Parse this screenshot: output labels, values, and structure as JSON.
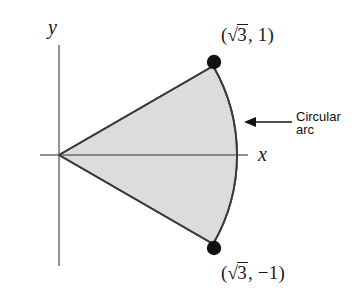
{
  "figure": {
    "background_color": "#ffffff",
    "axes": {
      "x_label": "x",
      "y_label": "y",
      "axis_color": "#6e6e6e",
      "origin_px": [
        59,
        155
      ],
      "x_axis_span_px": [
        40,
        248
      ],
      "y_axis_span_px": [
        45,
        266
      ]
    },
    "sector": {
      "fill_color": "#dcdcdc",
      "stroke_color": "#3a3a3a",
      "radius_units": 2,
      "angle_start_deg": -30,
      "angle_end_deg": 30,
      "center_units": [
        0,
        0
      ],
      "arc_apex_px": [
        237,
        155
      ]
    },
    "points": [
      {
        "name": "upper-endpoint",
        "label": "(√3, 1)",
        "label_x_text": "3",
        "label_y_text": "1",
        "coords_units": [
          1.732,
          1
        ],
        "px": [
          215,
          60
        ],
        "dot_color": "#111111",
        "dot_radius_px": 7
      },
      {
        "name": "lower-endpoint",
        "label": "(√3, −1)",
        "label_x_text": "3",
        "label_y_text": "−1",
        "coords_units": [
          1.732,
          -1
        ],
        "px": [
          215,
          248
        ],
        "dot_color": "#111111",
        "dot_radius_px": 7
      }
    ],
    "annotation": {
      "line_1": "Circular",
      "line_2": "arc",
      "arrow_direction": "left",
      "arrow_tail_px": [
        292,
        122
      ],
      "arrow_head_px": [
        246,
        122
      ],
      "arrow_color": "#111111"
    }
  },
  "labels": {
    "upper_point_prefix": "(",
    "upper_point_suffix": ", 1)",
    "lower_point_prefix": "(",
    "lower_point_suffix": ", −1)",
    "radicand": "3"
  }
}
